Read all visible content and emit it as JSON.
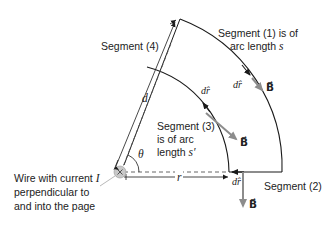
{
  "labels": {
    "segment4": "Segment (4)",
    "segment1_line1": "Segment (1) is of",
    "segment1_line2": "arc length s",
    "segment3_line1": "Segment (3)",
    "segment3_line2": "is of arc",
    "segment3_line3": "length s′",
    "segment2": "Segment (2)",
    "wire_line1": "Wire with current I",
    "wire_line2": "perpendicular to",
    "wire_line3": "and into the page",
    "d": "d",
    "r": "r",
    "theta": "θ",
    "dr_outer": "dr̂",
    "dr_inner": "dr̂",
    "dr_bottom": "dr̂",
    "B_outer": "B⃗",
    "B_inner": "B⃗",
    "B_bottom": "B⃗"
  },
  "colors": {
    "line": "#1a1a1a",
    "field_vector": "#8c8c8c",
    "wire_fill": "#c8c8c8",
    "dashed": "#555555"
  }
}
